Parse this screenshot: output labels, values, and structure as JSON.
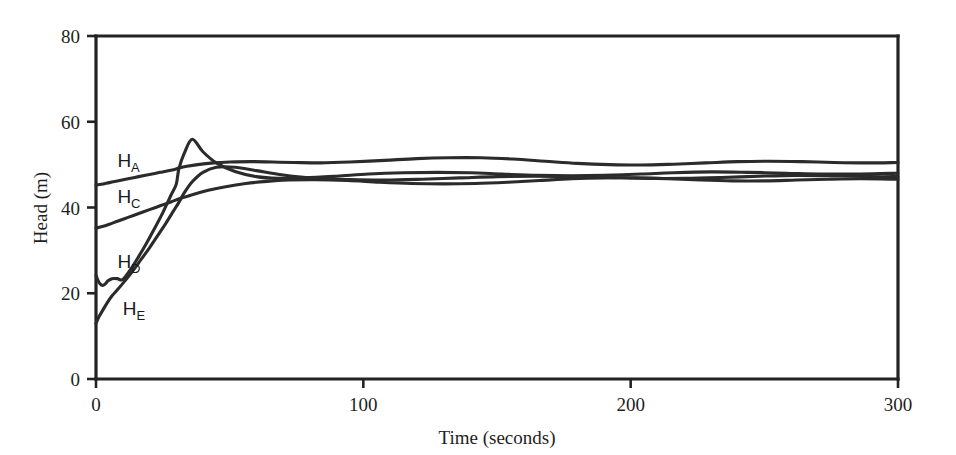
{
  "chart_data": {
    "type": "line",
    "title": "",
    "xlabel": "Time (seconds)",
    "ylabel": "Head (m)",
    "xlim": [
      0,
      300
    ],
    "ylim": [
      0,
      80
    ],
    "xticks": [
      0,
      100,
      200,
      300
    ],
    "yticks": [
      0,
      20,
      40,
      60,
      80
    ],
    "xtick_labels": [
      "0",
      "100",
      "200",
      "300"
    ],
    "ytick_labels": [
      "0",
      "20",
      "40",
      "60",
      "80"
    ],
    "grid": false,
    "legend_position": "inline-annotations",
    "annotations": [
      {
        "text": "H",
        "subscript": "A",
        "x": 8,
        "y": 49.5
      },
      {
        "text": "H",
        "subscript": "C",
        "x": 8,
        "y": 41.0
      },
      {
        "text": "H",
        "subscript": "D",
        "x": 8,
        "y": 26.0
      },
      {
        "text": "H",
        "subscript": "E",
        "x": 10,
        "y": 15.0
      }
    ],
    "series": [
      {
        "name": "H_A",
        "label": "HA",
        "color": "#2b2b2b",
        "x": [
          0,
          2,
          5,
          8,
          12,
          16,
          20,
          24,
          28,
          30,
          31,
          34,
          38,
          44,
          50,
          58,
          66,
          74,
          84,
          95,
          108,
          120,
          132,
          144,
          156,
          168,
          180,
          192,
          204,
          216,
          228,
          240,
          252,
          264,
          276,
          288,
          300
        ],
        "y": [
          45.2,
          45.4,
          45.8,
          46.2,
          46.7,
          47.2,
          47.7,
          48.2,
          48.7,
          49.0,
          49.2,
          49.6,
          50.0,
          50.4,
          50.6,
          50.7,
          50.6,
          50.5,
          50.4,
          50.6,
          51.0,
          51.4,
          51.6,
          51.6,
          51.3,
          50.8,
          50.3,
          50.0,
          49.9,
          50.1,
          50.4,
          50.7,
          50.8,
          50.7,
          50.5,
          50.4,
          50.5
        ]
      },
      {
        "name": "H_C",
        "label": "HC",
        "color": "#2b2b2b",
        "x": [
          0,
          2,
          5,
          8,
          12,
          16,
          20,
          24,
          28,
          32,
          36,
          42,
          48,
          56,
          64,
          72,
          82,
          94,
          106,
          118,
          130,
          142,
          154,
          166,
          178,
          190,
          202,
          214,
          226,
          238,
          250,
          262,
          274,
          286,
          300
        ],
        "y": [
          35.2,
          35.5,
          36.1,
          36.8,
          37.7,
          38.6,
          39.5,
          40.4,
          41.3,
          42.2,
          43.0,
          44.0,
          44.8,
          45.6,
          46.1,
          46.4,
          46.5,
          46.3,
          45.9,
          45.6,
          45.5,
          45.6,
          45.9,
          46.3,
          46.7,
          46.9,
          46.9,
          46.7,
          46.4,
          46.2,
          46.2,
          46.4,
          46.6,
          46.7,
          46.6
        ]
      },
      {
        "name": "H_D",
        "label": "HD",
        "color": "#2b2b2b",
        "x": [
          0,
          0.6,
          1.5,
          2.5,
          3.5,
          4.5,
          6,
          8,
          10,
          13,
          16,
          19,
          22,
          25,
          28,
          30,
          31,
          33,
          36,
          40,
          45,
          52,
          60,
          68,
          78,
          90,
          102,
          115,
          128,
          140,
          152,
          165,
          178,
          190,
          204,
          216,
          230,
          244,
          258,
          272,
          286,
          300
        ],
        "y": [
          24.2,
          23.2,
          22.2,
          21.8,
          22.2,
          22.9,
          23.4,
          23.4,
          23.2,
          25.6,
          28.6,
          31.8,
          35.2,
          38.8,
          42.8,
          45.4,
          49.0,
          52.6,
          55.9,
          53.0,
          50.4,
          48.4,
          47.2,
          46.8,
          46.9,
          47.3,
          47.8,
          48.1,
          48.2,
          48.1,
          47.8,
          47.5,
          47.4,
          47.5,
          47.8,
          48.1,
          48.3,
          48.2,
          48.0,
          47.8,
          47.8,
          48.0
        ]
      },
      {
        "name": "H_E",
        "label": "HE",
        "color": "#2b2b2b",
        "x": [
          0,
          1,
          2.5,
          4,
          6,
          8,
          11,
          14,
          17,
          20,
          23,
          26,
          29,
          31,
          33,
          36,
          40,
          45,
          52,
          60,
          70,
          82,
          95,
          108,
          122,
          136,
          150,
          164,
          178,
          192,
          206,
          220,
          234,
          248,
          262,
          276,
          290,
          300
        ],
        "y": [
          13.0,
          14.4,
          16.0,
          17.6,
          19.4,
          20.8,
          23.0,
          25.4,
          28.0,
          30.6,
          33.4,
          36.2,
          39.2,
          41.2,
          43.4,
          46.0,
          48.2,
          49.4,
          49.4,
          48.6,
          47.6,
          46.8,
          46.5,
          46.4,
          46.6,
          46.9,
          47.2,
          47.3,
          47.2,
          47.0,
          46.8,
          46.8,
          47.0,
          47.3,
          47.5,
          47.4,
          47.2,
          47.2
        ]
      }
    ]
  }
}
